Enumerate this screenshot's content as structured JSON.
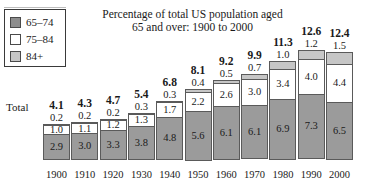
{
  "chart_data": {
    "type": "bar",
    "subtype": "stacked-bar",
    "title": "Percentage of total US population aged 65 and over: 1900 to 2000",
    "title_lines": [
      "Percentage of total US population aged",
      "65 and over: 1900 to 2000"
    ],
    "xlabel": "",
    "ylabel": "",
    "ylim": [
      0,
      12.6
    ],
    "grid": false,
    "legend_position": "top-left",
    "row_label": "Total",
    "categories": [
      "1900",
      "1910",
      "1920",
      "1930",
      "1940",
      "1950",
      "1960",
      "1970",
      "1980",
      "1990",
      "2000"
    ],
    "series": [
      {
        "name": "65-74",
        "color": "#9b9b9b",
        "values": [
          2.9,
          3.0,
          3.3,
          3.8,
          4.8,
          5.6,
          6.1,
          6.1,
          6.9,
          7.3,
          6.5
        ]
      },
      {
        "name": "75-84",
        "color": "#ffffff",
        "values": [
          1.0,
          1.1,
          1.2,
          1.3,
          1.7,
          2.2,
          2.6,
          3.0,
          3.4,
          4.0,
          4.4
        ]
      },
      {
        "name": "84+",
        "color": "#c6c6c6",
        "values": [
          0.2,
          0.2,
          0.2,
          0.3,
          0.3,
          0.4,
          0.5,
          0.7,
          1.0,
          1.2,
          1.5
        ]
      }
    ],
    "totals": [
      4.1,
      4.3,
      4.7,
      5.4,
      6.8,
      8.1,
      9.2,
      9.9,
      11.3,
      12.6,
      12.4
    ],
    "annotations": {
      "total_labels_shown": true,
      "84plus_labels_above_bar": true,
      "segment_labels_inside_bar": [
        "65-74",
        "75-84"
      ]
    }
  },
  "legend": {
    "items": [
      {
        "label": "65–74",
        "color": "#8d8d8d",
        "swatch": "swatch-65-74"
      },
      {
        "label": "75–84",
        "color": "#ffffff",
        "swatch": "swatch-75-84"
      },
      {
        "label": "84+",
        "color": "#c6c6c6",
        "swatch": "swatch-84-plus"
      }
    ]
  },
  "colors": {
    "age_65_74": "#9b9b9b",
    "age_75_84": "#ffffff",
    "age_84_plus": "#c6c6c6",
    "outline": "#5a5a5a",
    "text": "#1a1a1a",
    "background": "#ffffff"
  }
}
